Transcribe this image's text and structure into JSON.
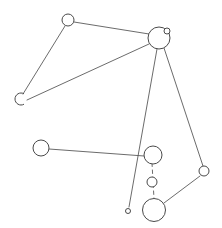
{
  "diagram": {
    "type": "node-link-graph",
    "background_color": "#ffffff",
    "stroke_color": "#4a4a4a",
    "edge_color": "#5a5a5a",
    "node_fill": "#ffffff",
    "width": 222,
    "height": 228,
    "node_count": 10,
    "edge_count": 8
  },
  "nodes": [
    {
      "id": "n1",
      "label": "node-top-left",
      "cx": 68,
      "cy": 20,
      "r": 6,
      "shape": "circle"
    },
    {
      "id": "n2",
      "label": "node-left-open-arc",
      "cx": 21,
      "cy": 99,
      "r": 6,
      "shape": "arc-open-right"
    },
    {
      "id": "n3",
      "label": "node-hub-top-right",
      "cx": 159,
      "cy": 38,
      "r": 11,
      "shape": "circle"
    },
    {
      "id": "n4",
      "label": "node-satellite-small",
      "cx": 167,
      "cy": 31,
      "r": 3,
      "shape": "circle"
    },
    {
      "id": "n5",
      "label": "node-mid-left",
      "cx": 41,
      "cy": 148,
      "r": 8,
      "shape": "circle"
    },
    {
      "id": "n6",
      "label": "node-chain-upper",
      "cx": 153,
      "cy": 155,
      "r": 9,
      "shape": "circle"
    },
    {
      "id": "n7",
      "label": "node-chain-middle",
      "cx": 152,
      "cy": 182,
      "r": 5,
      "shape": "circle"
    },
    {
      "id": "n8",
      "label": "node-chain-lower",
      "cx": 154,
      "cy": 210,
      "r": 11.5,
      "shape": "circle"
    },
    {
      "id": "n9",
      "label": "node-right",
      "cx": 204,
      "cy": 171,
      "r": 5,
      "shape": "circle"
    },
    {
      "id": "n10",
      "label": "node-tiny-bottom",
      "cx": 128,
      "cy": 211,
      "r": 2.5,
      "shape": "circle"
    }
  ],
  "edges": [
    {
      "id": "e1",
      "label": "edge-top-left-to-hub",
      "x1": 74,
      "y1": 22,
      "x2": 149,
      "y2": 34,
      "style": "solid"
    },
    {
      "id": "e2",
      "label": "edge-top-left-to-left-arc",
      "x1": 65,
      "y1": 26,
      "x2": 23,
      "y2": 94,
      "style": "solid"
    },
    {
      "id": "e3",
      "label": "edge-left-arc-to-hub",
      "x1": 27,
      "y1": 100,
      "x2": 149,
      "y2": 44,
      "style": "solid"
    },
    {
      "id": "e4",
      "label": "edge-hub-to-tiny-bottom",
      "x1": 157,
      "y1": 49,
      "x2": 129,
      "y2": 207,
      "style": "solid"
    },
    {
      "id": "e5",
      "label": "edge-hub-to-right-node",
      "x1": 164,
      "y1": 48,
      "x2": 203,
      "y2": 166,
      "style": "solid"
    },
    {
      "id": "e6",
      "label": "edge-mid-left-to-chain",
      "x1": 49,
      "y1": 149,
      "x2": 144,
      "y2": 156,
      "style": "solid"
    },
    {
      "id": "e7",
      "label": "edge-chain-vertical",
      "x1": 152,
      "y1": 163,
      "x2": 154,
      "y2": 199,
      "style": "dashed"
    },
    {
      "id": "e8",
      "label": "edge-chain-lower-to-right",
      "x1": 164,
      "y1": 203,
      "x2": 200,
      "y2": 176,
      "style": "solid"
    }
  ]
}
